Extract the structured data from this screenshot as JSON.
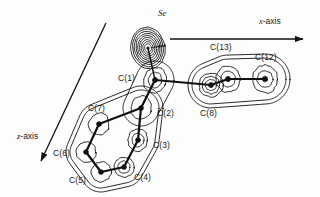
{
  "figure": {
    "kind": "electron-density-contour-map",
    "background_color": "#fdfdfd",
    "line_color": "#111111",
    "width": 320,
    "height": 197
  },
  "axes": {
    "x": {
      "label_text": "x-axis",
      "label_italic_part": "x",
      "label_rest": "-axis",
      "start": [
        170,
        39
      ],
      "end": [
        303,
        39
      ],
      "arrow": "end"
    },
    "z": {
      "label_text": "z-axis",
      "label_italic_part": "z",
      "label_rest": "-axis",
      "start": [
        106,
        23
      ],
      "end": [
        41,
        161
      ],
      "arrow": "end"
    }
  },
  "atoms": [
    {
      "id": "Se",
      "label": "Se",
      "italic": true,
      "x": 148,
      "y": 48,
      "label_x": 158,
      "label_y": 8,
      "contours": 9,
      "rx": 17,
      "ry": 21,
      "rot": -12
    },
    {
      "id": "C1",
      "label": "C(1)",
      "italic": false,
      "x": 155,
      "y": 80,
      "label_x": 118,
      "label_y": 73,
      "contours": 3,
      "rx": 11,
      "ry": 13,
      "rot": 20
    },
    {
      "id": "C2",
      "label": "C(2)",
      "italic": false,
      "x": 141,
      "y": 108,
      "label_x": 157,
      "label_y": 108,
      "contours": 2,
      "rx": 10,
      "ry": 12,
      "rot": 15
    },
    {
      "id": "C3",
      "label": "C(3)",
      "italic": false,
      "x": 138,
      "y": 140,
      "label_x": 153,
      "label_y": 140,
      "contours": 3,
      "rx": 10,
      "ry": 11,
      "rot": 0
    },
    {
      "id": "C4",
      "label": "C(4)",
      "italic": false,
      "x": 124,
      "y": 167,
      "label_x": 134,
      "label_y": 172,
      "contours": 3,
      "rx": 10,
      "ry": 10,
      "rot": 0
    },
    {
      "id": "C5",
      "label": "C(5)",
      "italic": false,
      "x": 101,
      "y": 172,
      "label_x": 69,
      "label_y": 175,
      "contours": 2,
      "rx": 10,
      "ry": 10,
      "rot": 0
    },
    {
      "id": "C6",
      "label": "C(6)",
      "italic": false,
      "x": 86,
      "y": 152,
      "label_x": 53,
      "label_y": 148,
      "contours": 2,
      "rx": 10,
      "ry": 10,
      "rot": 0
    },
    {
      "id": "C7",
      "label": "C(7)",
      "italic": false,
      "x": 99,
      "y": 124,
      "label_x": 88,
      "label_y": 103,
      "contours": 2,
      "rx": 10,
      "ry": 11,
      "rot": 25
    },
    {
      "id": "C8",
      "label": "C(8)",
      "italic": false,
      "x": 211,
      "y": 85,
      "label_x": 200,
      "label_y": 108,
      "contours": 4,
      "rx": 12,
      "ry": 12,
      "rot": 0
    },
    {
      "id": "C13",
      "label": "C(13)",
      "italic": false,
      "x": 228,
      "y": 79,
      "label_x": 210,
      "label_y": 42,
      "contours": 3,
      "rx": 12,
      "ry": 13,
      "rot": 0
    },
    {
      "id": "C12",
      "label": "C(12)",
      "italic": false,
      "x": 265,
      "y": 79,
      "label_x": 255,
      "label_y": 52,
      "contours": 3,
      "rx": 13,
      "ry": 14,
      "rot": 0
    }
  ],
  "bonds": [
    [
      "Se",
      "C1"
    ],
    [
      "C1",
      "C2"
    ],
    [
      "C1",
      "C8"
    ],
    [
      "C2",
      "C3"
    ],
    [
      "C2",
      "C7"
    ],
    [
      "C3",
      "C4"
    ],
    [
      "C4",
      "C5"
    ],
    [
      "C5",
      "C6"
    ],
    [
      "C6",
      "C7"
    ],
    [
      "C8",
      "C13"
    ],
    [
      "C13",
      "C12"
    ]
  ],
  "labels": [
    {
      "name": "label-Se",
      "text": "Se",
      "x": 158,
      "y": 8,
      "italic": true
    },
    {
      "name": "label-C1",
      "text": "C(1)",
      "x": 118,
      "y": 73,
      "italic": false
    },
    {
      "name": "label-C2",
      "text": "C(2)",
      "x": 157,
      "y": 108,
      "italic": false
    },
    {
      "name": "label-C3",
      "text": "C(3)",
      "x": 153,
      "y": 140,
      "italic": false
    },
    {
      "name": "label-C4",
      "text": "C(4)",
      "x": 134,
      "y": 172,
      "italic": false
    },
    {
      "name": "label-C5",
      "text": "C(5)",
      "x": 69,
      "y": 175,
      "italic": false
    },
    {
      "name": "label-C6",
      "text": "C(6)",
      "x": 53,
      "y": 148,
      "italic": false
    },
    {
      "name": "label-C7",
      "text": "C(7)",
      "x": 88,
      "y": 103,
      "italic": false
    },
    {
      "name": "label-C8",
      "text": "C(8)",
      "x": 200,
      "y": 108,
      "italic": false
    },
    {
      "name": "label-C13",
      "text": "C(13)",
      "x": 210,
      "y": 42,
      "italic": false
    },
    {
      "name": "label-C12",
      "text": "C(12)",
      "x": 255,
      "y": 52,
      "italic": false
    }
  ]
}
